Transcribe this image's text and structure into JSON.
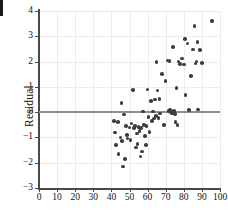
{
  "figure": {
    "kind": "residual-scatter-plot",
    "background_color": "#ffffff",
    "point_color": "#3d3d42",
    "grid_color": "#ececed",
    "axis_color": "#4a4a4a",
    "zero_line_color": "#8e8e8e",
    "edge_artifact": ""
  },
  "chart_data": {
    "type": "scatter",
    "title": "",
    "xlabel": "",
    "ylabel": "Residual",
    "xlim": [
      0,
      100
    ],
    "ylim": [
      -3,
      4
    ],
    "xticks": [
      0,
      10,
      20,
      30,
      40,
      50,
      60,
      70,
      80,
      90,
      100
    ],
    "yticks": [
      -3,
      -2,
      -1,
      0,
      1,
      2,
      3,
      4
    ],
    "xtick_labels": [
      "0",
      "10",
      "20",
      "30",
      "40",
      "50",
      "60",
      "70",
      "80",
      "90",
      "100"
    ],
    "ytick_labels": [
      "-3",
      "-2",
      "-1",
      "0",
      "1",
      "2",
      "3",
      "4"
    ],
    "grid": true,
    "grid_axes": "both",
    "legend": false,
    "reference_line": {
      "axis": "y",
      "value": 0,
      "style": "solid",
      "color": "#8e8e8e"
    },
    "series": [
      {
        "name": "residuals",
        "marker": "circle",
        "color": "#3d3d42",
        "x": [
          41.5,
          42.0,
          42.5,
          43.5,
          44.0,
          45.0,
          45.5,
          46.0,
          46.5,
          47.0,
          47.5,
          48.0,
          48.5,
          49.0,
          50.0,
          50.5,
          51.0,
          52.0,
          52.5,
          53.0,
          53.5,
          54.0,
          54.5,
          55.0,
          55.5,
          56.0,
          56.5,
          57.0,
          57.5,
          58.0,
          58.5,
          59.0,
          59.5,
          60.0,
          60.5,
          61.0,
          62.0,
          62.5,
          63.0,
          63.5,
          64.0,
          64.5,
          65.0,
          65.5,
          66.0,
          66.5,
          67.0,
          68.0,
          69.0,
          70.0,
          71.0,
          71.5,
          72.0,
          72.5,
          73.0,
          73.5,
          74.0,
          74.5,
          75.0,
          75.5,
          76.0,
          76.5,
          77.0,
          78.0,
          79.0,
          80.0,
          80.5,
          81.0,
          82.0,
          83.0,
          84.0,
          85.0,
          86.0,
          86.5,
          87.0,
          87.5,
          88.0,
          89.0,
          90.0,
          95.5
        ],
        "y": [
          -0.35,
          -0.8,
          -1.3,
          -0.4,
          -1.65,
          -1.0,
          0.35,
          -1.15,
          -2.15,
          -0.1,
          -1.85,
          -0.55,
          -0.9,
          -1.05,
          -0.6,
          -1.1,
          -0.45,
          0.88,
          -0.62,
          -0.55,
          -1.4,
          -0.85,
          -1.25,
          -0.58,
          -0.75,
          -1.75,
          -0.62,
          -1.55,
          0.02,
          -0.5,
          -0.95,
          -1.3,
          -0.55,
          0.9,
          -0.2,
          -0.78,
          0.45,
          -0.35,
          0.02,
          -0.25,
          0.5,
          -0.15,
          1.98,
          0.85,
          -0.22,
          0.52,
          -0.05,
          1.5,
          -0.5,
          1.22,
          2.05,
          0.05,
          2.02,
          0.08,
          0.0,
          -0.05,
          2.58,
          0.05,
          -0.08,
          -0.4,
          0.95,
          -0.52,
          2.0,
          1.9,
          2.12,
          1.88,
          2.9,
          0.68,
          2.72,
          0.08,
          1.42,
          2.48,
          3.4,
          1.92,
          2.0,
          2.78,
          0.1,
          2.45,
          1.95,
          3.6
        ]
      }
    ]
  }
}
